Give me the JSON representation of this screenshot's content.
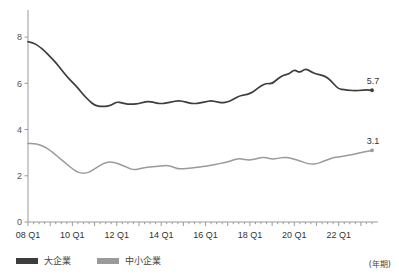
{
  "chart_data": {
    "type": "line",
    "title": "",
    "xlabel": "(年期)",
    "ylabel": "",
    "ylim": [
      0,
      9
    ],
    "yticks": [
      0,
      2,
      4,
      6,
      8
    ],
    "ytick_labels": [
      "0",
      "2",
      "4",
      "6",
      "8"
    ],
    "grid": false,
    "legend_position": "bottom-left",
    "x_tick_labels": [
      "08 Q1",
      "10 Q1",
      "12 Q1",
      "14 Q1",
      "16 Q1",
      "18 Q1",
      "20 Q1",
      "22 Q1"
    ],
    "x_tick_quarters": [
      0,
      8,
      16,
      24,
      32,
      40,
      48,
      56
    ],
    "x_range_quarters": [
      0,
      62
    ],
    "series": [
      {
        "name": "大企業",
        "color": "#3d3d3d",
        "end_label": "5.7",
        "end_value": 5.7,
        "values": [
          7.8,
          7.75,
          7.6,
          7.4,
          7.15,
          6.9,
          6.6,
          6.3,
          6.05,
          5.8,
          5.5,
          5.25,
          5.05,
          5.0,
          5.0,
          5.05,
          5.2,
          5.15,
          5.1,
          5.1,
          5.12,
          5.2,
          5.22,
          5.15,
          5.12,
          5.15,
          5.2,
          5.25,
          5.22,
          5.15,
          5.12,
          5.15,
          5.2,
          5.25,
          5.2,
          5.15,
          5.2,
          5.3,
          5.45,
          5.5,
          5.55,
          5.7,
          5.9,
          6.0,
          5.98,
          6.2,
          6.35,
          6.4,
          6.6,
          6.45,
          6.65,
          6.5,
          6.4,
          6.35,
          6.25,
          6.0,
          5.75,
          5.72,
          5.7,
          5.68,
          5.7,
          5.72,
          5.7
        ]
      },
      {
        "name": "中小企業",
        "color": "#9a9a9a",
        "end_label": "3.1",
        "end_value": 3.1,
        "values": [
          3.4,
          3.4,
          3.35,
          3.25,
          3.1,
          2.9,
          2.7,
          2.5,
          2.3,
          2.15,
          2.1,
          2.15,
          2.3,
          2.45,
          2.58,
          2.6,
          2.55,
          2.45,
          2.35,
          2.25,
          2.3,
          2.35,
          2.38,
          2.4,
          2.42,
          2.45,
          2.4,
          2.3,
          2.3,
          2.32,
          2.35,
          2.38,
          2.42,
          2.45,
          2.5,
          2.55,
          2.6,
          2.68,
          2.75,
          2.7,
          2.68,
          2.72,
          2.8,
          2.78,
          2.72,
          2.75,
          2.8,
          2.78,
          2.72,
          2.65,
          2.55,
          2.5,
          2.52,
          2.6,
          2.7,
          2.78,
          2.82,
          2.85,
          2.9,
          2.95,
          3.0,
          3.05,
          3.1
        ]
      }
    ]
  },
  "legend": {
    "items": [
      {
        "label": "大企業",
        "color": "#3d3d3d"
      },
      {
        "label": "中小企業",
        "color": "#9a9a9a"
      }
    ]
  },
  "axis_note": "(年期)"
}
